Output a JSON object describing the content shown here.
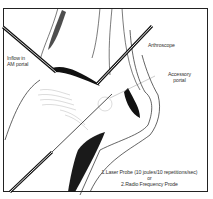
{
  "figure": {
    "type": "medical illustration"
  },
  "labels": {
    "inflow_line1": "Inflow in",
    "inflow_line2": "AM portal",
    "arthroscope": "Arthroscope",
    "accessory_line1": "Accessory",
    "accessory_line2": "portal",
    "probe_line1": "1.Laser Probe (10 joules/10 repetitions/sec)",
    "probe_or": "or",
    "probe_line2": "2.Radio Frequency Prode"
  },
  "colors": {
    "ink": "#111111",
    "text": "#333333",
    "background": "#ffffff"
  }
}
